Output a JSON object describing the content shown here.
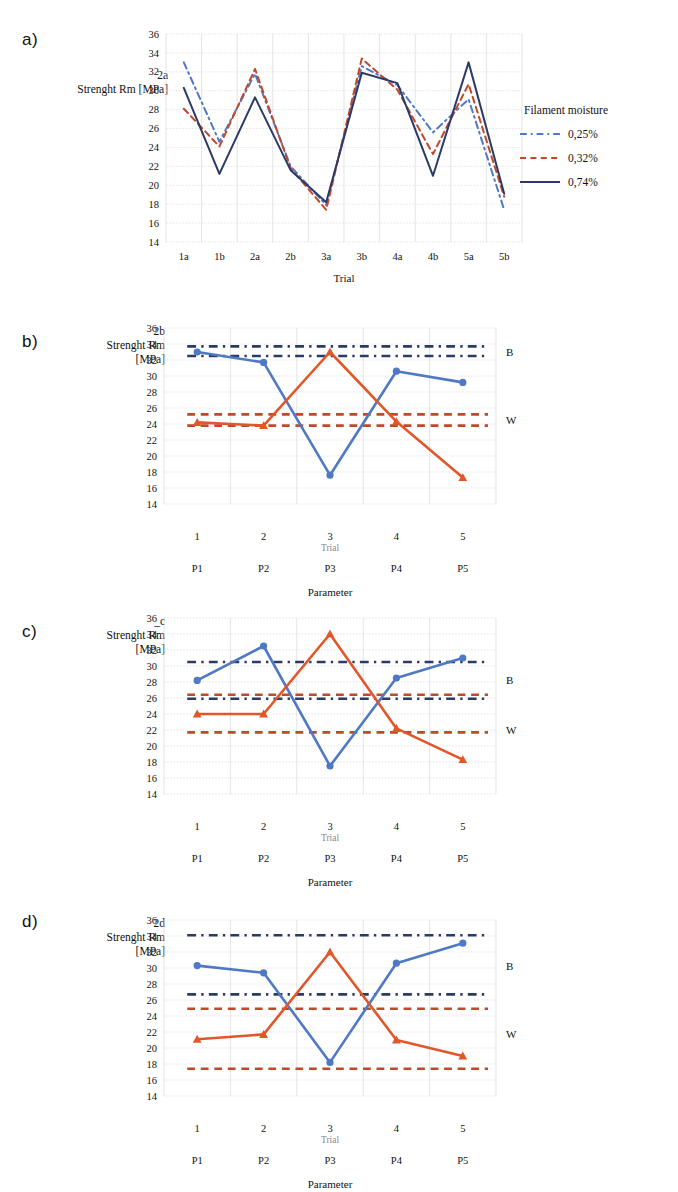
{
  "figure": {
    "background": "#ffffff",
    "colors": {
      "blue": "#4f79c4",
      "red": "#e2562a",
      "red_dash": "#c0482b",
      "navy": "#2b3a67",
      "grid": "#d9d9d9",
      "text": "#111111"
    }
  },
  "panels": [
    {
      "id": "a",
      "letter": "a)",
      "y_title_lines": [
        "2a",
        "Strenght Rm [MPa]"
      ],
      "legend": {
        "title": "Filament moisture",
        "items": [
          {
            "label": "0,25%",
            "color": "#4f79c4",
            "style": "dashdot"
          },
          {
            "label": "0,32%",
            "color": "#c0482b",
            "style": "dashed"
          },
          {
            "label": "0,74%",
            "color": "#2b3a67",
            "style": "solid"
          }
        ]
      },
      "chart_data": {
        "type": "line",
        "title": "",
        "xlabel": "Trial",
        "ylabel": "Strenght Rm [MPa]",
        "categories": [
          "1a",
          "1b",
          "2a",
          "2b",
          "3a",
          "3b",
          "4a",
          "4b",
          "5a",
          "5b"
        ],
        "ylim": [
          14,
          36
        ],
        "yticks": [
          14,
          16,
          18,
          20,
          22,
          24,
          26,
          28,
          30,
          32,
          34,
          36
        ],
        "grid": true,
        "legend_position": "right",
        "series": [
          {
            "name": "0,25%",
            "color": "#4f79c4",
            "style": "dashdot",
            "values": [
              33.0,
              24.6,
              31.8,
              22.0,
              17.9,
              32.6,
              30.6,
              25.6,
              29.1,
              17.4
            ]
          },
          {
            "name": "0,32%",
            "color": "#c0482b",
            "style": "dashed",
            "values": [
              28.1,
              24.1,
              32.3,
              21.8,
              17.4,
              33.4,
              30.1,
              23.3,
              30.7,
              18.8
            ]
          },
          {
            "name": "0,74%",
            "color": "#2b3a67",
            "style": "solid",
            "values": [
              30.3,
              21.2,
              29.3,
              21.6,
              18.2,
              31.9,
              30.8,
              21.0,
              33.0,
              19.1
            ]
          }
        ]
      }
    },
    {
      "id": "b",
      "letter": "b)",
      "y_title_lines": [
        "2b",
        "Strenght Rm",
        "[MPa]"
      ],
      "chart_data": {
        "type": "line",
        "title": "",
        "xlabel": "Parameter",
        "xlabel_secondary": "Trial",
        "ylabel": "Strenght Rm [MPa]",
        "categories": [
          "1",
          "2",
          "3",
          "4",
          "5"
        ],
        "categories_secondary": [
          "P1",
          "P2",
          "P3",
          "P4",
          "P5"
        ],
        "ylim": [
          14,
          36
        ],
        "yticks": [
          14,
          16,
          18,
          20,
          22,
          24,
          26,
          28,
          30,
          32,
          34,
          36
        ],
        "grid": true,
        "annotations": [
          {
            "label": "B",
            "y": 33.0
          },
          {
            "label": "W",
            "y": 24.5
          }
        ],
        "reference_lines": [
          {
            "value": 33.7,
            "color": "#2b3a67",
            "style": "dashdot"
          },
          {
            "value": 32.5,
            "color": "#2b3a67",
            "style": "dashdot"
          },
          {
            "value": 25.2,
            "color": "#c0482b",
            "style": "dashed"
          },
          {
            "value": 23.8,
            "color": "#c0482b",
            "style": "dashed"
          }
        ],
        "series": [
          {
            "name": "B",
            "color": "#4f79c4",
            "marker": "circle",
            "values": [
              33.0,
              31.7,
              17.6,
              30.6,
              29.2
            ]
          },
          {
            "name": "W",
            "color": "#e2562a",
            "marker": "triangle",
            "values": [
              24.2,
              23.8,
              33.0,
              24.3,
              17.3
            ]
          }
        ]
      }
    },
    {
      "id": "c",
      "letter": "c)",
      "y_title_lines": [
        "_c",
        "Strenght Rm",
        "[MPa]"
      ],
      "chart_data": {
        "type": "line",
        "title": "",
        "xlabel": "Parameter",
        "xlabel_secondary": "Trial",
        "ylabel": "Strenght Rm [MPa]",
        "categories": [
          "1",
          "2",
          "3",
          "4",
          "5"
        ],
        "categories_secondary": [
          "P1",
          "P2",
          "P3",
          "P4",
          "P5"
        ],
        "ylim": [
          14,
          36
        ],
        "yticks": [
          14,
          16,
          18,
          20,
          22,
          24,
          26,
          28,
          30,
          32,
          34,
          36
        ],
        "grid": true,
        "annotations": [
          {
            "label": "B",
            "y": 28.2
          },
          {
            "label": "W",
            "y": 22.0
          }
        ],
        "reference_lines": [
          {
            "value": 30.5,
            "color": "#2b3a67",
            "style": "dashdot"
          },
          {
            "value": 25.9,
            "color": "#2b3a67",
            "style": "dashdot"
          },
          {
            "value": 26.4,
            "color": "#c0482b",
            "style": "dashed"
          },
          {
            "value": 21.7,
            "color": "#c0482b",
            "style": "dashed"
          }
        ],
        "series": [
          {
            "name": "B",
            "color": "#4f79c4",
            "marker": "circle",
            "values": [
              28.2,
              32.5,
              17.5,
              28.5,
              31.0
            ]
          },
          {
            "name": "W",
            "color": "#e2562a",
            "marker": "triangle",
            "values": [
              24.0,
              24.0,
              34.0,
              22.2,
              18.3
            ]
          }
        ]
      }
    },
    {
      "id": "d",
      "letter": "d)",
      "y_title_lines": [
        "2d",
        "Strenght Rm",
        "[MPa]"
      ],
      "chart_data": {
        "type": "line",
        "title": "",
        "xlabel": "Parameter",
        "xlabel_secondary": "Trial",
        "ylabel": "Strenght Rm [MPa]",
        "categories": [
          "1",
          "2",
          "3",
          "4",
          "5"
        ],
        "categories_secondary": [
          "P1",
          "P2",
          "P3",
          "P4",
          "P5"
        ],
        "ylim": [
          14,
          36
        ],
        "yticks": [
          14,
          16,
          18,
          20,
          22,
          24,
          26,
          28,
          30,
          32,
          34,
          36
        ],
        "grid": true,
        "annotations": [
          {
            "label": "B",
            "y": 30.2
          },
          {
            "label": "W",
            "y": 21.8
          }
        ],
        "reference_lines": [
          {
            "value": 34.1,
            "color": "#2b3a67",
            "style": "dashdot"
          },
          {
            "value": 26.7,
            "color": "#2b3a67",
            "style": "dashdot"
          },
          {
            "value": 24.9,
            "color": "#c0482b",
            "style": "dashed"
          },
          {
            "value": 17.4,
            "color": "#c0482b",
            "style": "dashed"
          }
        ],
        "series": [
          {
            "name": "B",
            "color": "#4f79c4",
            "marker": "circle",
            "values": [
              30.3,
              29.4,
              18.2,
              30.6,
              33.1
            ]
          },
          {
            "name": "W",
            "color": "#e2562a",
            "marker": "triangle",
            "values": [
              21.1,
              21.7,
              32.0,
              21.0,
              19.0
            ]
          }
        ]
      }
    }
  ]
}
